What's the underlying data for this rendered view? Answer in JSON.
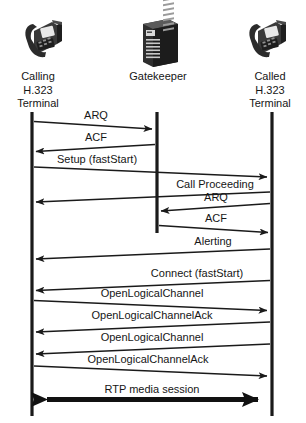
{
  "diagram": {
    "type": "sequence-diagram",
    "colors": {
      "background": "#ffffff",
      "line": "#1a1a1a",
      "text": "#161616",
      "icon_dark": "#2b2b2b",
      "icon_mid": "#555555",
      "icon_light": "#9a9a9a"
    },
    "actors": [
      {
        "id": "calling",
        "label": "Calling\nH.323\nTerminal",
        "icon": "desk-phone-icon",
        "x": 32
      },
      {
        "id": "gatekeeper",
        "label": "Gatekeeper",
        "icon": "server-tower-icon",
        "x": 157
      },
      {
        "id": "called",
        "label": "Called\nH.323\nTerminal",
        "icon": "desk-phone-icon",
        "x": 272
      }
    ],
    "messages": [
      {
        "label": "ARQ",
        "from": "calling",
        "to": "gatekeeper",
        "direction": "right",
        "y": 126,
        "style": "thin"
      },
      {
        "label": "ACF",
        "from": "gatekeeper",
        "to": "calling",
        "direction": "left",
        "y": 148,
        "style": "thin"
      },
      {
        "label": "Setup (fastStart)",
        "from": "calling",
        "to": "called",
        "direction": "right",
        "y": 172,
        "style": "thin"
      },
      {
        "label": "Call Proceeding",
        "from": "called",
        "to": "calling",
        "direction": "left",
        "y": 196,
        "style": "thin"
      },
      {
        "label": "ARQ",
        "from": "called",
        "to": "gatekeeper",
        "direction": "left",
        "y": 208,
        "style": "thin"
      },
      {
        "label": "ACF",
        "from": "gatekeeper",
        "to": "called",
        "direction": "right",
        "y": 230,
        "style": "thin"
      },
      {
        "label": "Alerting",
        "from": "called",
        "to": "calling",
        "direction": "left",
        "y": 254,
        "style": "thin"
      },
      {
        "label": "Connect (fastStart)",
        "from": "called",
        "to": "calling",
        "direction": "left",
        "y": 288,
        "style": "thin"
      },
      {
        "label": "OpenLogicalChannel",
        "from": "calling",
        "to": "called",
        "direction": "right",
        "y": 322,
        "style": "thin"
      },
      {
        "label": "OpenLogicalChannelAck",
        "from": "called",
        "to": "calling",
        "direction": "left",
        "y": 352,
        "style": "thin"
      },
      {
        "label": "OpenLogicalChannel",
        "from": "called",
        "to": "calling",
        "direction": "left",
        "y": 382,
        "style": "thin"
      },
      {
        "label": "OpenLogicalChannelAck",
        "from": "calling",
        "to": "called",
        "direction": "right",
        "y": 412,
        "style": "thin"
      },
      {
        "label": "RTP media session",
        "from": "calling",
        "to": "called",
        "direction": "both",
        "y": 442,
        "style": "thick"
      }
    ],
    "lifelines": [
      {
        "actor": "calling",
        "x": 32,
        "y_start": 112,
        "y_end": 416
      },
      {
        "actor": "gatekeeper",
        "x": 157,
        "y_start": 112,
        "y_end": 233
      },
      {
        "actor": "called",
        "x": 272,
        "y_start": 112,
        "y_end": 416
      }
    ]
  }
}
